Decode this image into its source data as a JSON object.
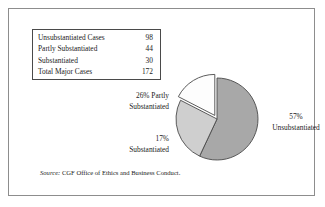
{
  "figure": {
    "source_prefix": "Source:",
    "source_text": "CGF Office of Ethics and Business Conduct."
  },
  "table": {
    "rows": [
      {
        "label": "Unsubstantiated Cases",
        "value": "98"
      },
      {
        "label": "Partly Substantiated",
        "value": "44"
      },
      {
        "label": "Substantiated",
        "value": "30"
      },
      {
        "label": "Total Major Cases",
        "value": "172"
      }
    ]
  },
  "labels": {
    "partly_line1": "26% Partly",
    "partly_line2": "Substantiated",
    "subst_line1": "17%",
    "subst_line2": "Substantiated",
    "unsubst_line1": "57%",
    "unsubst_line2": "Unsubstantiated"
  },
  "chart_data": {
    "type": "pie",
    "title": "",
    "categories": [
      "Unsubstantiated",
      "Partly Substantiated",
      "Substantiated"
    ],
    "values": [
      98,
      44,
      30
    ],
    "percentages": [
      57,
      26,
      17
    ],
    "total": 172,
    "total_label": "Total Major Cases",
    "value_labels": [
      "98",
      "44",
      "30"
    ],
    "slice_colors": [
      "#a8a8a8",
      "#cfcfcf",
      "#fdfdfd"
    ],
    "slice_edge_color": "#4a4a4a",
    "exploded_slice": "Substantiated",
    "start_angle_deg": 0,
    "direction": "clockwise",
    "legend": "none",
    "labels_position": "outside",
    "grid": false
  }
}
